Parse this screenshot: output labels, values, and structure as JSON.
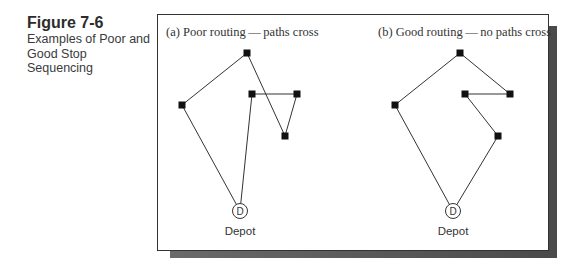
{
  "caption": {
    "figure_number": "Figure 7-6",
    "title": "Examples of Poor and Good Stop Sequencing"
  },
  "panels": [
    {
      "id": "a",
      "title": "(a) Poor routing — paths cross",
      "depot_letter": "D",
      "depot_label": "Depot",
      "route_order": [
        "depot",
        "left",
        "top",
        "bottom",
        "right",
        "middle",
        "depot"
      ]
    },
    {
      "id": "b",
      "title": "(b) Good routing — no paths cross",
      "depot_letter": "D",
      "depot_label": "Depot",
      "route_order": [
        "depot",
        "left",
        "top",
        "right",
        "middle",
        "bottom",
        "depot"
      ]
    }
  ],
  "colors": {
    "line": "#333333",
    "stop": "#111111",
    "depot_stroke": "#333333"
  }
}
